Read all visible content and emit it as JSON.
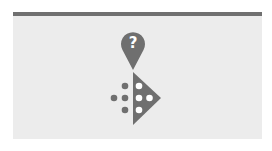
{
  "illustration": {
    "pin_icon": "question-mark-location-pin-icon",
    "pin_glyph": "?",
    "shape_icon": "triangle-with-dots-icon",
    "colors": {
      "background": "#ececec",
      "topbar": "#707070",
      "icon": "#6f6f6f",
      "dot_inner": "#ffffff"
    }
  }
}
